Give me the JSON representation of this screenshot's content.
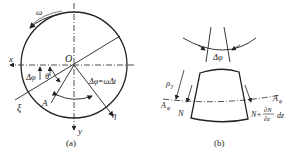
{
  "figure_a": {
    "caption": "(a)",
    "labels": {
      "omega": "ω",
      "x": "x",
      "y": "y",
      "origin": "O",
      "xi": "ξ",
      "eta": "η",
      "point_A": "A",
      "delta_phi": "Δφ",
      "theta": "θ",
      "delta_phi_eq": "Δφ=ωΔt"
    }
  },
  "figure_b": {
    "caption": "(b)",
    "labels": {
      "delta_phi": "Δφ",
      "rho": "ρ",
      "rho_sub": "y",
      "A_left": "A",
      "A_right": "A",
      "A_sub": "φ",
      "N": "N",
      "N_plus": "N+",
      "dN": "∂N",
      "dz_den": "∂z",
      "dz": "dz"
    }
  },
  "colors": {
    "ink": "#222222",
    "background": "#ffffff"
  }
}
